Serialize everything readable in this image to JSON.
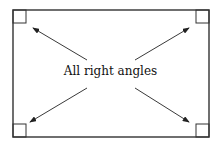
{
  "diagram": {
    "label": "All right angles",
    "rectangle": {
      "x": 13,
      "y": 10,
      "width": 196,
      "height": 127
    },
    "corner_marker_size": 13,
    "arrows": [
      {
        "from": [
          87,
          60
        ],
        "to": [
          33,
          28
        ],
        "target": "top-left corner"
      },
      {
        "from": [
          135,
          60
        ],
        "to": [
          189,
          28
        ],
        "target": "top-right corner"
      },
      {
        "from": [
          87,
          88
        ],
        "to": [
          30,
          122
        ],
        "target": "bottom-left corner"
      },
      {
        "from": [
          135,
          88
        ],
        "to": [
          189,
          122
        ],
        "target": "bottom-right corner"
      }
    ],
    "stroke_color": "#222222"
  }
}
